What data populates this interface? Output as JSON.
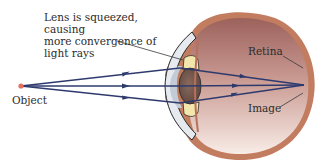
{
  "diagram": {
    "caption_lines": [
      "Lens is squeezed, causing",
      "more convergence of",
      "light rays"
    ],
    "labels": {
      "object": "Object",
      "retina": "Retina",
      "image": "Image"
    },
    "colors": {
      "ray": "#2e3a6e",
      "object_dot": "#e8705a",
      "eye_wall": "#c07a5e",
      "eye_interior_top": "#a46a62",
      "eye_interior_bottom": "#f6e4dc",
      "lens": "#7a5a4e",
      "ciliary": "#f1e3a8",
      "cornea": "#c9d2da",
      "leader_line": "#3a3a3a"
    },
    "rays": [
      {
        "name": "upper",
        "from": [
          21,
          86
        ],
        "via": [
          180,
          68
        ],
        "to": [
          304,
          85
        ]
      },
      {
        "name": "middle",
        "from": [
          21,
          86
        ],
        "via": [
          180,
          86
        ],
        "to": [
          304,
          85
        ]
      },
      {
        "name": "lower",
        "from": [
          21,
          86
        ],
        "via": [
          180,
          103
        ],
        "to": [
          304,
          85
        ]
      }
    ]
  }
}
